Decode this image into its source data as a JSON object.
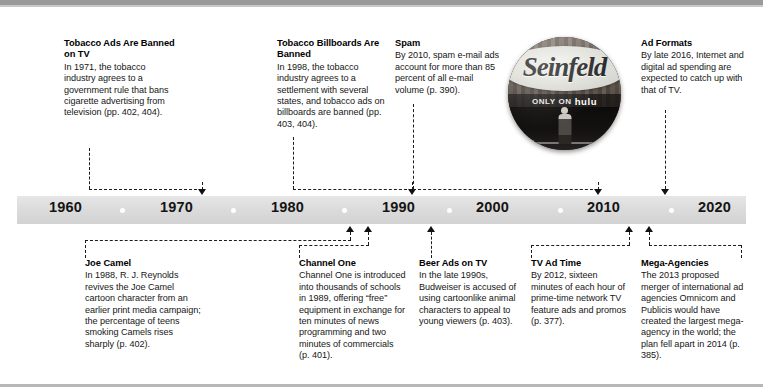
{
  "figure": {
    "type": "timeline",
    "axis": {
      "years": [
        "1960",
        "1970",
        "1980",
        "1990",
        "2000",
        "2010",
        "2020"
      ],
      "range": [
        1955,
        2025
      ]
    }
  },
  "events_above": [
    {
      "id": "tobacco-ads",
      "title": "Tobacco Ads Are Banned on TV",
      "body": "In 1971, the tobacco industry agrees to a government rule that bans cigarette advertising from television (pp. 402, 404).",
      "year": 1971
    },
    {
      "id": "tobacco-billboards",
      "title": "Tobacco Billboards Are Banned",
      "body": "In 1998, the tobacco industry agrees to a settlement with several states, and tobacco ads on billboards are banned (pp. 403, 404).",
      "year": 1998
    },
    {
      "id": "spam",
      "title": "Spam",
      "body": "By 2010, spam e-mail ads account for more than 85 percent of all e-mail volume (p. 390).",
      "year": 2010
    },
    {
      "id": "ad-formats",
      "title": "Ad Formats",
      "body": "By late 2016, Internet and digital ad spending are expected to catch up with that of TV.",
      "year": 2016
    }
  ],
  "events_below": [
    {
      "id": "joe-camel",
      "title": "Joe Camel",
      "body": "In 1988, R. J. Reynolds revives the Joe Camel cartoon character from an earlier print media campaign; the percentage of teens smoking Camels rises sharply (p. 402).",
      "year": 1988
    },
    {
      "id": "channel-one",
      "title": "Channel One",
      "body": "Channel One is introduced into thousands of schools in 1989, offering “free” equipment in exchange for ten minutes of news programming and two minutes of commercials (p. 401).",
      "year": 1989
    },
    {
      "id": "beer-ads",
      "title": "Beer Ads on TV",
      "body": "In the late 1990s, Budweiser is accused of using cartoonlike animal characters to appeal to young viewers (p. 403).",
      "year": 1998
    },
    {
      "id": "tv-ad-time",
      "title": "TV Ad Time",
      "body": "By 2012, sixteen minutes of each hour of prime-time network TV feature ads and promos (p. 377).",
      "year": 2012
    },
    {
      "id": "mega-agencies",
      "title": "Mega-Agencies",
      "body": "The 2013 proposed merger of international ad agencies Omnicom and Publicis would have created the largest mega-agency in the world; the plan fell apart in 2014 (p. 385).",
      "year": 2013
    }
  ],
  "photo": {
    "brand": "Seinfeld",
    "tagline_prefix": "ONLY ON",
    "tagline_brand": "hulu",
    "alt": "Seinfeld only on Hulu promotional billboard"
  }
}
